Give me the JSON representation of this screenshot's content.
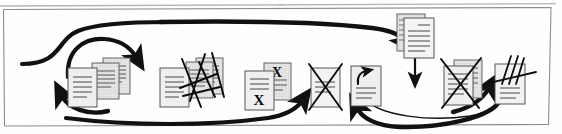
{
  "figure": {
    "frame": {
      "border_color": "#8d8d8d",
      "background": "#fefefe"
    },
    "ink_color": "#111111",
    "page_fill": "#eeeeee",
    "page_stroke": "#555555",
    "rule_color": "#333333",
    "caption_fragment": "p"
  },
  "stages": [
    {
      "id": "stage-1",
      "name": "document-stack-loop",
      "label": "Draft documents in revision loop",
      "page_count": 3,
      "mark": "none"
    },
    {
      "id": "stage-2",
      "name": "scribbled-documents",
      "label": "Documents struck through with scribbles",
      "page_count": 3,
      "mark": "scribble"
    },
    {
      "id": "stage-3",
      "name": "x-marked-documents",
      "label": "Documents annotated with X letters",
      "page_count": 2,
      "mark": "letter-x",
      "glyph": "X"
    },
    {
      "id": "stage-4",
      "name": "crossed-out-document",
      "label": "Single rejected document",
      "page_count": 1,
      "mark": "big-x"
    },
    {
      "id": "stage-5",
      "name": "arrow-marked-document",
      "label": "Document marked with move arrow",
      "page_count": 1,
      "mark": "curved-arrow"
    },
    {
      "id": "stage-6",
      "name": "clean-document-pair",
      "label": "Fresh pair of documents feeding in from above",
      "page_count": 2,
      "mark": "none"
    },
    {
      "id": "stage-7",
      "name": "crossed-out-document-pair",
      "label": "Rejected pair of documents",
      "page_count": 2,
      "mark": "big-x"
    },
    {
      "id": "stage-8",
      "name": "slashed-document",
      "label": "Document with tally slashes",
      "page_count": 1,
      "mark": "slashes"
    }
  ],
  "connectors": [
    {
      "id": "entry-curve",
      "name": "inbound-s-curve",
      "style": "thick",
      "head": false
    },
    {
      "id": "loop-top",
      "name": "cycle-arrow-top",
      "style": "thick",
      "head": true
    },
    {
      "id": "loop-bottom",
      "name": "cycle-arrow-bottom",
      "style": "thick",
      "head": true
    },
    {
      "id": "overhead-sweep",
      "name": "overhead-feed-arrow",
      "style": "thick",
      "head": true
    },
    {
      "id": "feedback-long",
      "name": "long-feedback-arrow",
      "style": "thick",
      "head": true
    },
    {
      "id": "drop-arrow",
      "name": "downward-insert-arrow",
      "style": "thin",
      "head": true
    },
    {
      "id": "return-outer",
      "name": "return-arrow-outer",
      "style": "thick",
      "head": true
    },
    {
      "id": "return-inner",
      "name": "return-arrow-inner",
      "style": "thin",
      "head": false
    },
    {
      "id": "rise-arrow",
      "name": "rise-arrow-right",
      "style": "thick",
      "head": true
    }
  ]
}
